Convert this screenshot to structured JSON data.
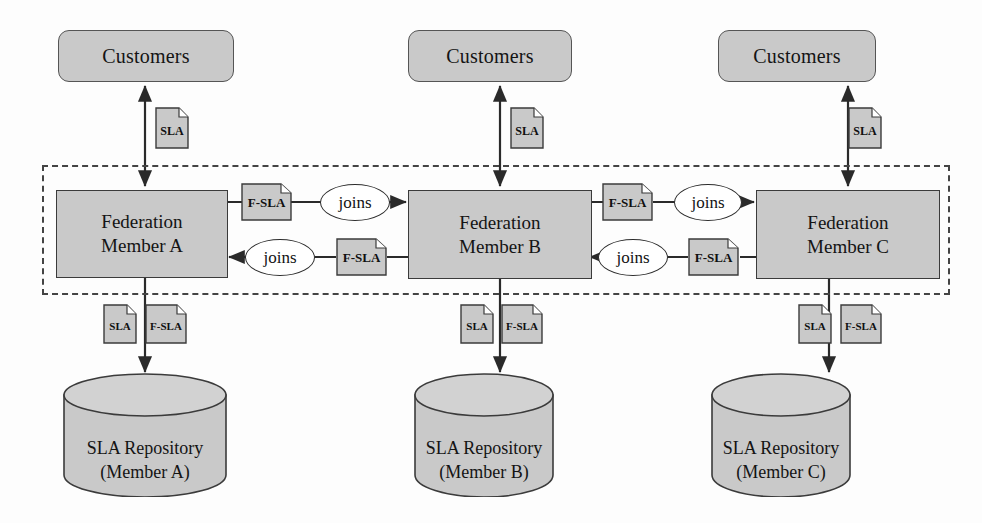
{
  "diagram": {
    "colors": {
      "node_fill": "#c9c9c9",
      "node_stroke": "#3b3b3b",
      "line": "#2a2a2a",
      "boundary": "#444444",
      "ellipse_fill": "#ffffff"
    },
    "boundary_label": "",
    "columns": [
      {
        "id": "a",
        "customers_label": "Customers",
        "member_line1": "Federation",
        "member_line2": "Member A",
        "customer_doc": "SLA",
        "repo_doc_1": "SLA",
        "repo_doc_2": "F-SLA",
        "repository_line1": "SLA Repository",
        "repository_line2": "(Member A)"
      },
      {
        "id": "b",
        "customers_label": "Customers",
        "member_line1": "Federation",
        "member_line2": "Member B",
        "customer_doc": "SLA",
        "repo_doc_1": "SLA",
        "repo_doc_2": "F-SLA",
        "repository_line1": "SLA Repository",
        "repository_line2": "(Member B)"
      },
      {
        "id": "c",
        "customers_label": "Customers",
        "member_line1": "Federation",
        "member_line2": "Member C",
        "customer_doc": "SLA",
        "repo_doc_1": "SLA",
        "repo_doc_2": "F-SLA",
        "repository_line1": "SLA Repository",
        "repository_line2": "(Member C)"
      }
    ],
    "links": [
      {
        "id": "ab-top",
        "from": "Federation Member A",
        "to": "Federation Member B",
        "doc": "F-SLA",
        "relation": "joins",
        "direction": "right"
      },
      {
        "id": "ba-bottom",
        "from": "Federation Member B",
        "to": "Federation Member A",
        "doc": "F-SLA",
        "relation": "joins",
        "direction": "left"
      },
      {
        "id": "bc-top",
        "from": "Federation Member B",
        "to": "Federation Member C",
        "doc": "F-SLA",
        "relation": "joins",
        "direction": "right"
      },
      {
        "id": "cb-bottom",
        "from": "Federation Member C",
        "to": "Federation Member B",
        "doc": "F-SLA",
        "relation": "joins",
        "direction": "left"
      }
    ]
  }
}
